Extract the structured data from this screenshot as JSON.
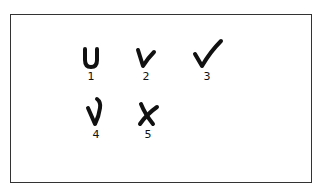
{
  "figure": {
    "marks": [
      {
        "id": 1,
        "label": "1",
        "shape": "u-shape",
        "description": "U-shaped mark"
      },
      {
        "id": 2,
        "label": "2",
        "shape": "v-check",
        "description": "V-shaped check mark"
      },
      {
        "id": 3,
        "label": "3",
        "shape": "check-mark",
        "description": "Check mark with long right stroke"
      },
      {
        "id": 4,
        "label": "4",
        "shape": "check-hook",
        "description": "Check mark with hooked top"
      },
      {
        "id": 5,
        "label": "5",
        "shape": "x-mark",
        "description": "X mark"
      }
    ],
    "colors": {
      "ink": "#111111",
      "border": "#333333",
      "background": "#ffffff"
    }
  }
}
